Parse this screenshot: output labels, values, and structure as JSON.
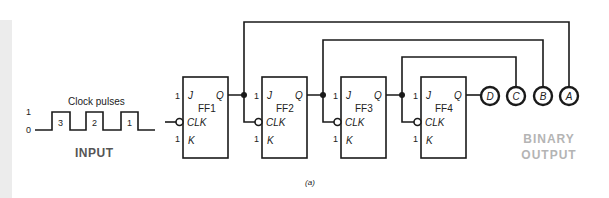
{
  "figure": {
    "caption": "(a)",
    "input": {
      "title": "Clock pulses",
      "section_label": "INPUT",
      "level_high": "1",
      "level_low": "0",
      "pulse_numbers": [
        "3",
        "2",
        "1"
      ]
    },
    "flip_flops": [
      {
        "name": "FF1",
        "j_input": "1",
        "k_input": "1",
        "pins": {
          "j": "J",
          "k": "K",
          "clk": "CLK",
          "q": "Q"
        }
      },
      {
        "name": "FF2",
        "j_input": "1",
        "k_input": "1",
        "pins": {
          "j": "J",
          "k": "K",
          "clk": "CLK",
          "q": "Q"
        }
      },
      {
        "name": "FF3",
        "j_input": "1",
        "k_input": "1",
        "pins": {
          "j": "J",
          "k": "K",
          "clk": "CLK",
          "q": "Q"
        }
      },
      {
        "name": "FF4",
        "j_input": "1",
        "k_input": "1",
        "pins": {
          "j": "J",
          "k": "K",
          "clk": "CLK",
          "q": "Q"
        }
      }
    ],
    "outputs": {
      "labels": [
        "D",
        "C",
        "B",
        "A"
      ],
      "section_label_line1": "BINARY",
      "section_label_line2": "OUTPUT"
    },
    "colors": {
      "line": "#1a1a1a",
      "output_label": "#b4b4b4",
      "input_label": "#555555",
      "left_strip": "#ececec"
    }
  }
}
